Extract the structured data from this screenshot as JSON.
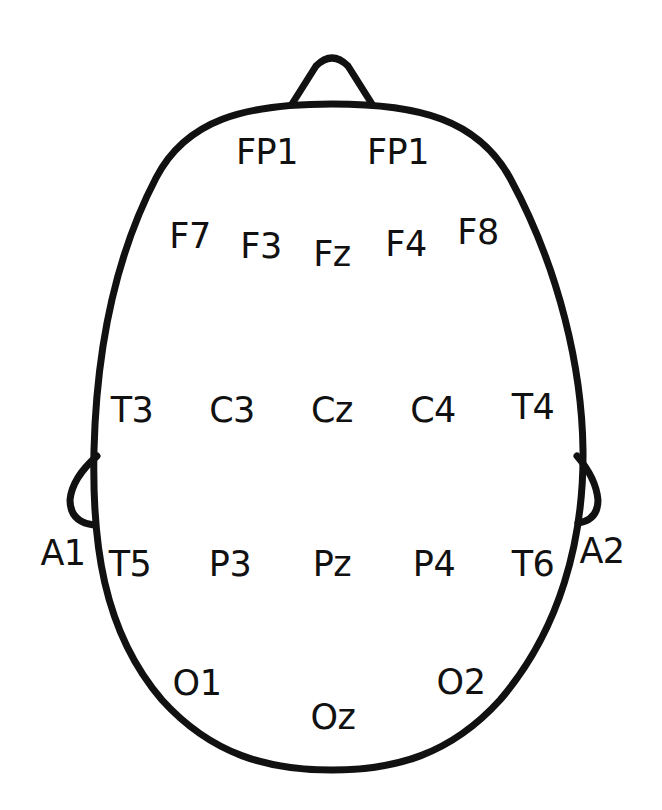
{
  "diagram": {
    "colors": {
      "outline": "#111111",
      "text": "#111111",
      "background": "#ffffff"
    },
    "electrodes": [
      {
        "id": "fp1-left",
        "label": "FP1",
        "x": 267,
        "y": 152
      },
      {
        "id": "fp1-right",
        "label": "FP1",
        "x": 398,
        "y": 152
      },
      {
        "id": "f7",
        "label": "F7",
        "x": 190,
        "y": 236
      },
      {
        "id": "f3",
        "label": "F3",
        "x": 261,
        "y": 246
      },
      {
        "id": "fz",
        "label": "Fz",
        "x": 332,
        "y": 254
      },
      {
        "id": "f4",
        "label": "F4",
        "x": 406,
        "y": 244
      },
      {
        "id": "f8",
        "label": "F8",
        "x": 478,
        "y": 232
      },
      {
        "id": "t3",
        "label": "T3",
        "x": 132,
        "y": 410
      },
      {
        "id": "c3",
        "label": "C3",
        "x": 232,
        "y": 410
      },
      {
        "id": "cz",
        "label": "Cz",
        "x": 332,
        "y": 410
      },
      {
        "id": "c4",
        "label": "C4",
        "x": 433,
        "y": 410
      },
      {
        "id": "t4",
        "label": "T4",
        "x": 533,
        "y": 407
      },
      {
        "id": "a1",
        "label": "A1",
        "x": 63,
        "y": 553
      },
      {
        "id": "t5",
        "label": "T5",
        "x": 130,
        "y": 564
      },
      {
        "id": "p3",
        "label": "P3",
        "x": 230,
        "y": 564
      },
      {
        "id": "pz",
        "label": "Pz",
        "x": 332,
        "y": 564
      },
      {
        "id": "p4",
        "label": "P4",
        "x": 434,
        "y": 564
      },
      {
        "id": "t6",
        "label": "T6",
        "x": 533,
        "y": 564
      },
      {
        "id": "a2",
        "label": "A2",
        "x": 602,
        "y": 551
      },
      {
        "id": "o1",
        "label": "O1",
        "x": 197,
        "y": 683
      },
      {
        "id": "oz",
        "label": "Oz",
        "x": 333,
        "y": 717
      },
      {
        "id": "o2",
        "label": "O2",
        "x": 461,
        "y": 682
      }
    ]
  }
}
